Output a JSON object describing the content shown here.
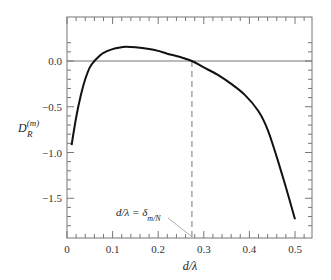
{
  "chart_data": {
    "type": "line",
    "title": "",
    "xlabel": "d/λ",
    "ylabel": "D_R^(m)",
    "ylabel_main": "D",
    "ylabel_sub": "R",
    "ylabel_sup": "(m)",
    "xlim": [
      0,
      0.55
    ],
    "ylim": [
      -1.85,
      0.3
    ],
    "xticks": [
      0,
      0.1,
      0.2,
      0.3,
      0.4,
      0.5
    ],
    "xtick_labels": [
      "0",
      "0.1",
      "0.2",
      "0.3",
      "0.4",
      "0.5"
    ],
    "yticks": [
      0.0,
      -0.5,
      -1.0,
      -1.5
    ],
    "ytick_labels": [
      "0.0",
      "−0.5",
      "−1.0",
      "−1.5"
    ],
    "grid": false,
    "reference_line_y": 0.0,
    "dashed_line_x": 0.274,
    "annotation": {
      "text": "d/λ = δ",
      "subscript": "m/N",
      "points_to": [
        0.274,
        -1.85
      ]
    },
    "series": [
      {
        "name": "D_R^(m)",
        "x": [
          0.01,
          0.02,
          0.03,
          0.04,
          0.05,
          0.06,
          0.07,
          0.08,
          0.1,
          0.12,
          0.13,
          0.15,
          0.18,
          0.2,
          0.22,
          0.25,
          0.274,
          0.3,
          0.33,
          0.36,
          0.39,
          0.42,
          0.44,
          0.46,
          0.48,
          0.5
        ],
        "values": [
          -0.92,
          -0.62,
          -0.38,
          -0.2,
          -0.07,
          0.0,
          0.05,
          0.09,
          0.13,
          0.15,
          0.155,
          0.15,
          0.13,
          0.11,
          0.08,
          0.04,
          0.0,
          -0.07,
          -0.15,
          -0.25,
          -0.37,
          -0.55,
          -0.75,
          -1.05,
          -1.38,
          -1.73
        ]
      }
    ]
  }
}
